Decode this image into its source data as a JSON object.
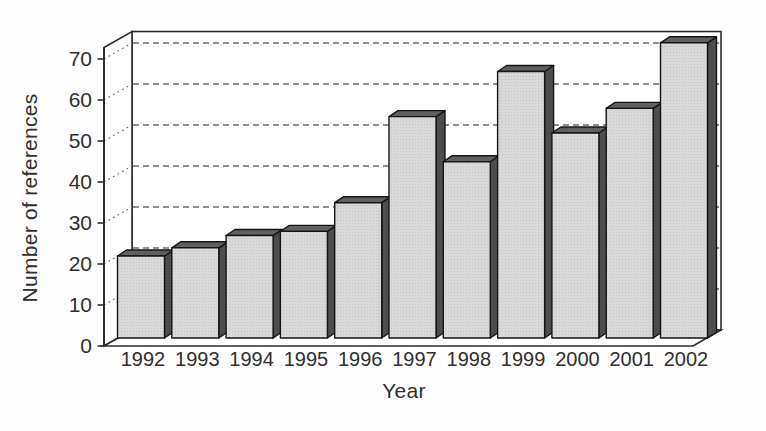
{
  "figure": {
    "background": "#fefefe"
  },
  "chart_data": {
    "type": "bar",
    "style": "3d-column",
    "title": "",
    "xlabel": "Year",
    "ylabel": "Number of references",
    "categories": [
      "1992",
      "1993",
      "1994",
      "1995",
      "1996",
      "1997",
      "1998",
      "1999",
      "2000",
      "2001",
      "2002"
    ],
    "values": [
      20,
      22,
      25,
      26,
      33,
      54,
      43,
      65,
      50,
      56,
      72
    ],
    "ylim": [
      0,
      70
    ],
    "yticks": [
      0,
      10,
      20,
      30,
      40,
      50,
      60,
      70
    ],
    "grid": "horizontal-dashed",
    "legend_position": "none",
    "colors": {
      "bar_front": "#d9d9d9",
      "bar_front_dot": "#bfbfbf",
      "bar_top": "#606060",
      "bar_side": "#4d4d4d",
      "bar_outline": "#161616",
      "gridline": "#6b6b6b",
      "axis_line": "#2d2d2d",
      "text": "#2f2f2f",
      "wall_fill": "#ffffff"
    }
  }
}
